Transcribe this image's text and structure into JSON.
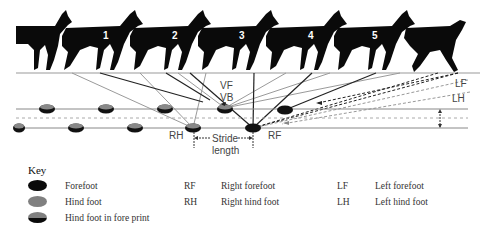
{
  "diagram": {
    "animal_numbers": [
      "1",
      "2",
      "3",
      "4",
      "5"
    ],
    "labels": {
      "vf": "VF",
      "vb": "VB",
      "lf": "LF",
      "lh": "LH",
      "rh": "RH",
      "rf": "RF",
      "stride_line1": "Stride",
      "stride_line2": "length"
    },
    "colors": {
      "forefoot": "#111111",
      "hind_foot": "#808080",
      "line_dark": "#222222",
      "line_gray": "#999999"
    }
  },
  "key": {
    "title": "Key",
    "prints": [
      {
        "label": "Forefoot",
        "icon": "forefoot-print"
      },
      {
        "label": "Hind foot",
        "icon": "hind-foot-print"
      },
      {
        "label": "Hind foot in fore print",
        "icon": "hind-in-fore-print"
      }
    ],
    "abbreviations": [
      {
        "abbr": "RF",
        "meaning": "Right forefoot"
      },
      {
        "abbr": "RH",
        "meaning": "Right hind foot"
      },
      {
        "abbr": "LF",
        "meaning": "Left forefoot"
      },
      {
        "abbr": "LH",
        "meaning": "Left hind foot"
      }
    ]
  }
}
